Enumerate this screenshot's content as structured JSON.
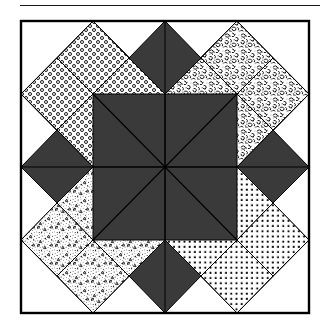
{
  "page": {
    "kind": "quilt-block-diagram",
    "title": "",
    "background_color": "#ffffff"
  },
  "rule": {
    "name": "top-horizontal-rule",
    "x": 20,
    "y": 5,
    "width": 300,
    "color": "#1a1a1a"
  },
  "frame": {
    "x": 21,
    "y": 21,
    "width": 288,
    "height": 292,
    "stroke": "#000000",
    "stroke_width": 2,
    "fill": "#ffffff"
  },
  "colors": {
    "dark_fabric": "#3a3a3a",
    "background_fabric": "#ffffff",
    "outline": "#000000",
    "rule": "#1a1a1a"
  },
  "layout": {
    "grid": "2x2 quadrant blocks",
    "block_count": 4,
    "center_motif": "eight-wedge dark octagon"
  },
  "blocks": [
    {
      "id": "block-top-left",
      "position": "top-left",
      "fabric_name": "ring-dots",
      "fabric_label": "open circle rings",
      "star_points": 4
    },
    {
      "id": "block-top-right",
      "position": "top-right",
      "fabric_name": "mottled-squiggle",
      "fabric_label": "mottled paisley squiggle",
      "star_points": 4
    },
    {
      "id": "block-bottom-left",
      "position": "bottom-left",
      "fabric_name": "stipple-triangles",
      "fabric_label": "fine stipple with triangles",
      "star_points": 4
    },
    {
      "id": "block-bottom-right",
      "position": "bottom-right",
      "fabric_name": "square-dots",
      "fabric_label": "regular square polka dots",
      "star_points": 4
    }
  ]
}
